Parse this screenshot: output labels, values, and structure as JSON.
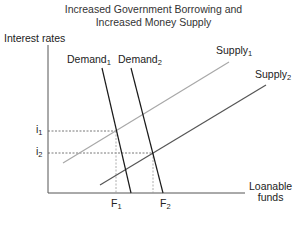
{
  "title": {
    "line1": "Increased Government Borrowing and",
    "line2": "Increased Money Supply"
  },
  "axes": {
    "y_label": "Interest rates",
    "x_label_line1": "Loanable",
    "x_label_line2": "funds"
  },
  "curves": {
    "demand1": {
      "name": "Demand",
      "sub": "1",
      "color": "#1a1a1a"
    },
    "demand2": {
      "name": "Demand",
      "sub": "2",
      "color": "#1a1a1a"
    },
    "supply1": {
      "name": "Supply",
      "sub": "1",
      "color": "#a8a8a8"
    },
    "supply2": {
      "name": "Supply",
      "sub": "2",
      "color": "#555555"
    }
  },
  "markers": {
    "i1": {
      "name": "i",
      "sub": "1"
    },
    "i2": {
      "name": "i",
      "sub": "2"
    },
    "F1": {
      "name": "F",
      "sub": "1"
    },
    "F2": {
      "name": "F",
      "sub": "2"
    }
  }
}
